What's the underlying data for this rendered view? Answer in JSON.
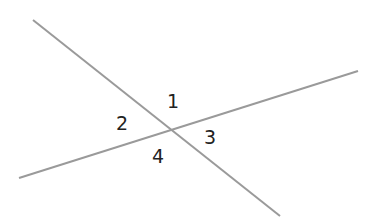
{
  "diagram": {
    "line_color": "#9a9a9a",
    "label_color": "#222222",
    "lines": [
      {
        "name": "line-a",
        "x1": 33,
        "y1": 20,
        "x2": 280,
        "y2": 216
      },
      {
        "name": "line-b",
        "x1": 19,
        "y1": 178,
        "x2": 358,
        "y2": 71
      }
    ],
    "angles": [
      {
        "label": "1",
        "x": 167,
        "y": 92
      },
      {
        "label": "2",
        "x": 116,
        "y": 114
      },
      {
        "label": "3",
        "x": 204,
        "y": 128
      },
      {
        "label": "4",
        "x": 152,
        "y": 147
      }
    ]
  }
}
